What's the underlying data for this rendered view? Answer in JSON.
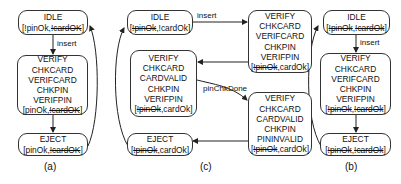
{
  "panels": {
    "a": {
      "label": "(a)",
      "idle": {
        "name": "IDLE",
        "guard_open": "[",
        "g1": "!pinOk",
        "sep": ",",
        "g2": "!cardOK",
        "guard_close": "]"
      },
      "verify": {
        "lines": [
          "VERIFY",
          "CHKCARD",
          "VERIFCARD",
          "CHKPIN",
          "VERIFPIN"
        ],
        "guard_open": "[",
        "g1": "pinOk",
        "sep": ",",
        "g2": "!cardOK",
        "guard_close": "]"
      },
      "eject": {
        "name": "EJECT",
        "guard_open": "[",
        "g1": "pinOk",
        "sep": ",",
        "g2": "!cardOK",
        "guard_close": "]"
      },
      "edges": {
        "insert": "insert"
      }
    },
    "c": {
      "label": "(c)",
      "idle": {
        "name": "IDLE",
        "guard_open": "[",
        "g1": "!pinOk",
        "sep": ",",
        "g2": "!cardOk",
        "guard_close": "]"
      },
      "verify_top": {
        "lines": [
          "VERIFY",
          "CHKCARD",
          "VERIFCARD",
          "CHKPIN",
          "VERIFPIN"
        ],
        "guard_open": "[",
        "g1": "!pinOk",
        "sep": ",",
        "g2": "cardOk",
        "guard_close": "]"
      },
      "verify_left": {
        "lines": [
          "VERIFY",
          "CHKCARD",
          "CARDVALID",
          "CHKPIN",
          "VERIFPIN"
        ],
        "guard_open": "[",
        "g1": "!pinOk",
        "sep": ",",
        "g2": "cardOk",
        "guard_close": "]"
      },
      "verify_right": {
        "lines": [
          "VERIFY",
          "CHKCARD",
          "CARDVALID",
          "CHKPIN",
          "PININVALID"
        ],
        "guard_open": "[",
        "g1": "!pinOk",
        "sep": ",",
        "g2": "cardOk",
        "guard_close": "]"
      },
      "eject": {
        "name": "EJECT",
        "guard_open": "[",
        "g1": "!pinOk",
        "sep": ",",
        "g2": "cardOk",
        "guard_close": "]"
      },
      "edges": {
        "insert": "insert",
        "pinChkDone": "pinChkDone"
      }
    },
    "b": {
      "label": "(b)",
      "idle": {
        "name": "IDLE",
        "guard_open": "[",
        "g1": "!pinOk",
        "sep": ",",
        "g2": "!cardOk",
        "guard_close": "]"
      },
      "verify": {
        "lines": [
          "VERIFY",
          "CHKCARD",
          "VERIFCARD",
          "CHKPIN",
          "VERIFPIN"
        ],
        "guard_open": "[",
        "g1": "!pinOk",
        "sep": ",",
        "g2": "!cardOk",
        "guard_close": "]"
      },
      "eject": {
        "name": "EJECT",
        "guard_open": "[",
        "g1": "!pinOk",
        "sep": ",",
        "g2": "!cardOk",
        "guard_close": "]"
      },
      "edges": {
        "insert": "insert"
      }
    }
  }
}
